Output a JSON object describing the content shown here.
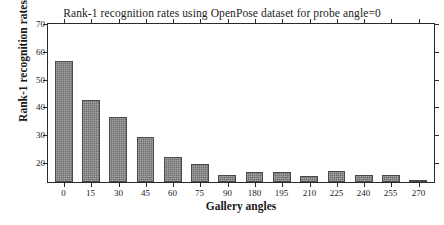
{
  "chart_data": {
    "type": "bar",
    "title": "Rank-1 recognition rates using OpenPose dataset for probe angle=0",
    "xlabel": "Gallery angles",
    "ylabel": "Rank-1 recognition rates",
    "categories": [
      "0",
      "15",
      "30",
      "45",
      "60",
      "75",
      "90",
      "180",
      "195",
      "210",
      "225",
      "240",
      "255",
      "270"
    ],
    "values": [
      55.8,
      42.0,
      35.8,
      28.5,
      21.3,
      19.0,
      15.0,
      16.0,
      16.0,
      14.5,
      16.5,
      15.0,
      15.0,
      12.8
    ],
    "ylim": [
      12.4,
      70
    ],
    "yticks": [
      20,
      30,
      40,
      50,
      60,
      70
    ],
    "ytick_labels": [
      "20",
      "30",
      "40",
      "50",
      "60",
      "70"
    ],
    "grid": false,
    "legend": null,
    "bar_color": "#6e6e6e",
    "bar_edge_color": "#4a4a4a",
    "axis_color": "#2a2a2a",
    "background": "#ffffff"
  }
}
